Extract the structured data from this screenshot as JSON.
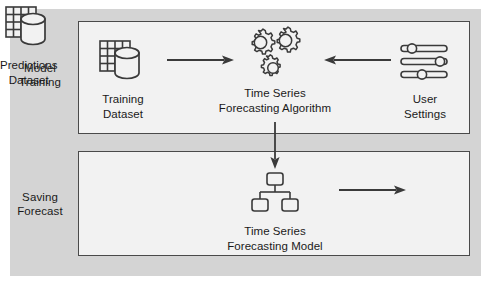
{
  "diagram": {
    "background_color": "#ffffff",
    "panel_color": "#d4d4d4",
    "stage_fill": "#f2f2f2",
    "stage_border_color": "#4a4a4a",
    "ink_color": "#3a3a3a",
    "text_color": "#1a1a1a"
  },
  "phases": [
    {
      "id": "model-training",
      "label": "Model\nTraining"
    },
    {
      "id": "saving-forecast",
      "label": "Saving\nForecast"
    }
  ],
  "nodes": [
    {
      "id": "training-dataset",
      "icon": "dataset-icon",
      "caption": "Training\nDataset",
      "phase": "model-training"
    },
    {
      "id": "forecasting-algorithm",
      "icon": "gears-icon",
      "caption": "Time Series\nForecasting Algorithm",
      "phase": "model-training"
    },
    {
      "id": "user-settings",
      "icon": "sliders-icon",
      "caption": "User\nSettings",
      "phase": "model-training"
    },
    {
      "id": "forecasting-model",
      "icon": "hierarchy-icon",
      "caption": "Time Series\nForecasting Model",
      "phase": "saving-forecast"
    },
    {
      "id": "predictions-dataset",
      "icon": "dataset-icon",
      "caption": "Predictions\nDataset",
      "phase": "saving-forecast"
    }
  ],
  "arrows": [
    {
      "id": "dataset-to-algorithm",
      "from": "training-dataset",
      "to": "forecasting-algorithm",
      "direction": "right"
    },
    {
      "id": "settings-to-algorithm",
      "from": "user-settings",
      "to": "forecasting-algorithm",
      "direction": "left"
    },
    {
      "id": "algorithm-to-model",
      "from": "forecasting-algorithm",
      "to": "forecasting-model",
      "direction": "down"
    },
    {
      "id": "model-to-predictions",
      "from": "forecasting-model",
      "to": "predictions-dataset",
      "direction": "right"
    }
  ]
}
